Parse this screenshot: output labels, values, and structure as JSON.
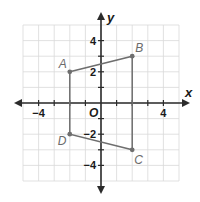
{
  "diagram": {
    "type": "coordinate-plane",
    "grid": {
      "xmin": -5,
      "xmax": 5,
      "ymin": -5,
      "ymax": 5,
      "step": 1
    },
    "axes": {
      "x_label": "x",
      "y_label": "y",
      "origin_label": "O",
      "x_ticks": [
        {
          "value": -4,
          "label": "−4"
        },
        {
          "value": 4,
          "label": "4"
        }
      ],
      "y_ticks": [
        {
          "value": 4,
          "label": "4"
        },
        {
          "value": 2,
          "label": "2"
        },
        {
          "value": -2,
          "label": "−2"
        },
        {
          "value": -4,
          "label": "−4"
        }
      ]
    },
    "polygon": {
      "name": "ABCD",
      "vertices": [
        {
          "label": "A",
          "x": -2,
          "y": 2
        },
        {
          "label": "B",
          "x": 2,
          "y": 3
        },
        {
          "label": "C",
          "x": 2,
          "y": -3
        },
        {
          "label": "D",
          "x": -2,
          "y": -2
        }
      ]
    },
    "colors": {
      "grid": "#d9d9d9",
      "axis": "#2b2b2b",
      "polygon": "#6e6e6e",
      "point": "#6e6e6e",
      "label": "#6b6b6b"
    }
  }
}
